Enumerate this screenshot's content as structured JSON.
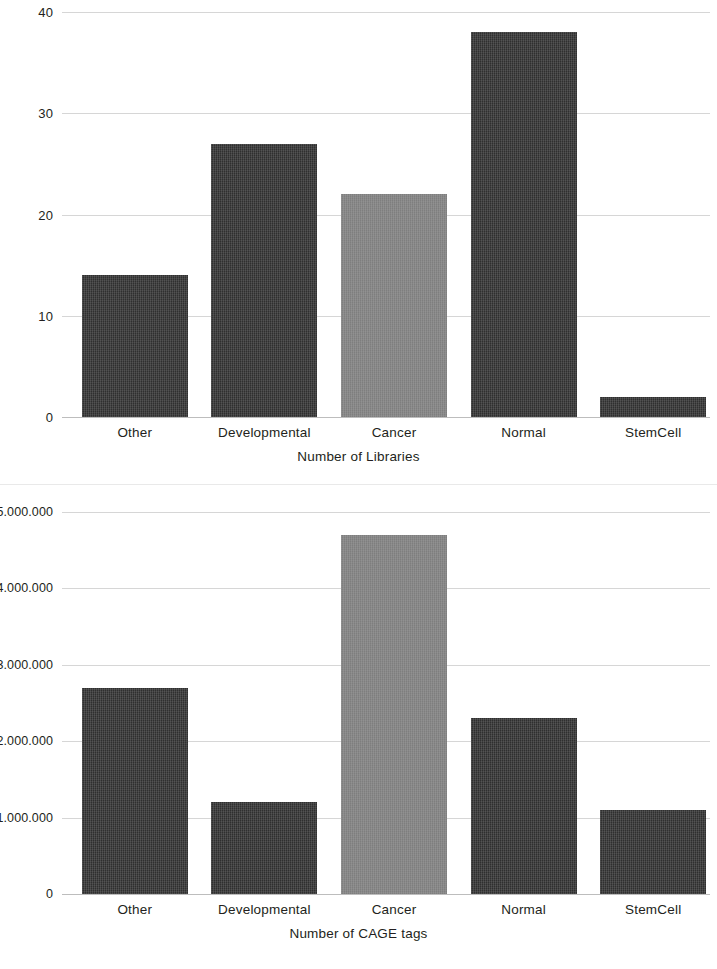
{
  "chart_data": [
    {
      "type": "bar",
      "id": "number-of-libraries",
      "title": "",
      "xlabel": "Number of Libraries",
      "ylabel": "",
      "categories": [
        "Other",
        "Developmental",
        "Cancer",
        "Normal",
        "StemCell"
      ],
      "values": [
        14,
        27,
        22,
        38,
        2
      ],
      "ylim": [
        0,
        40
      ],
      "yticks": [
        0,
        10,
        20,
        30,
        40
      ],
      "ytick_labels": [
        "0",
        "10",
        "20",
        "30",
        "40"
      ],
      "grid": true,
      "legend": "none",
      "bar_colors": [
        "#2f2f2f",
        "#2f2f2f",
        "#858585",
        "#2f2f2f",
        "#2f2f2f"
      ],
      "highlight_category": "Cancer"
    },
    {
      "type": "bar",
      "id": "number-of-cage-tags",
      "title": "",
      "xlabel": "Number of CAGE tags",
      "ylabel": "",
      "categories": [
        "Other",
        "Developmental",
        "Cancer",
        "Normal",
        "StemCell"
      ],
      "values": [
        2700000,
        1200000,
        4700000,
        2300000,
        1100000
      ],
      "ylim": [
        0,
        5000000
      ],
      "yticks": [
        0,
        1000000,
        2000000,
        3000000,
        4000000,
        5000000
      ],
      "ytick_labels": [
        "0",
        "1.000.000",
        "2.000.000",
        "3.000.000",
        "4.000.000",
        "5.000.000"
      ],
      "grid": true,
      "legend": "none",
      "bar_colors": [
        "#2f2f2f",
        "#2f2f2f",
        "#858585",
        "#2f2f2f",
        "#2f2f2f"
      ],
      "highlight_category": "Cancer"
    }
  ]
}
